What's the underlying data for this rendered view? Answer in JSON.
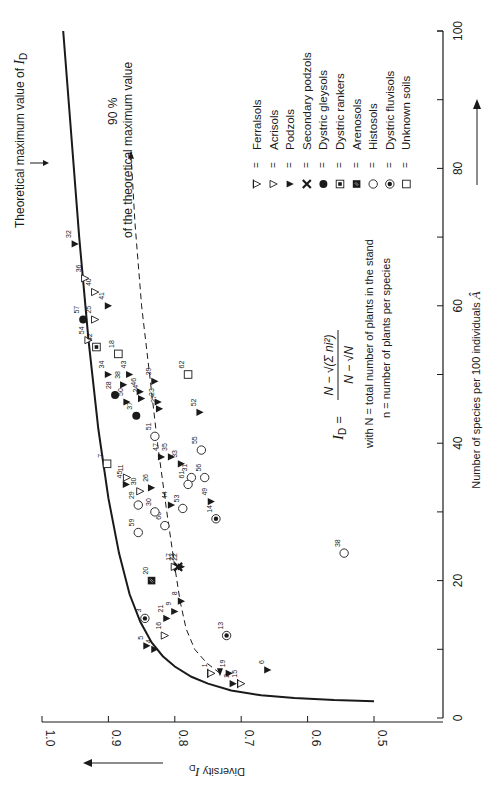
{
  "chart_data": {
    "type": "scatter",
    "orientation": "rotated 90 degrees counterclockwise (x-axis on right side, y-axis along bottom)",
    "title": "",
    "xlabel": "Number of species per 100 individuals Â",
    "ylabel": "Diversity I_D",
    "xlim": [
      0,
      100
    ],
    "ylim": [
      0.5,
      1.0
    ],
    "x_ticks": [
      0,
      20,
      40,
      60,
      80,
      100
    ],
    "y_ticks": [
      "1.0",
      "0.9",
      "0.8",
      "0.7",
      "0.6",
      "0.5"
    ],
    "grid": false,
    "legend_position": "upper right (rotated)",
    "legend": [
      {
        "symbol": "⧖",
        "key": "ferralsols",
        "label": "Ferralsols"
      },
      {
        "symbol": "▽",
        "key": "acrisols",
        "label": "Acrisols"
      },
      {
        "symbol": "▼",
        "key": "podzols",
        "label": "Podzols"
      },
      {
        "symbol": "✖",
        "key": "secondary_podzols",
        "label": "Secondary podzols"
      },
      {
        "symbol": "●",
        "key": "dystric_gleysols",
        "label": "Dystric gleysols"
      },
      {
        "symbol": "⊡",
        "key": "dystric_rankers",
        "label": "Dystric rankers"
      },
      {
        "symbol": "■",
        "key": "arenosols",
        "label": "Arenosols"
      },
      {
        "symbol": "○",
        "key": "histosols",
        "label": "Histosols"
      },
      {
        "symbol": "◉",
        "key": "dystric_fluvisols",
        "label": "Dystric fluvisols"
      },
      {
        "symbol": "□",
        "key": "unknown",
        "label": "Unknown soils"
      }
    ],
    "annotations": [
      "Theoretical maximum value of I_D",
      "90 % of the theoretical maximum value",
      "I_D = (N − √(Σ ni²)) / (N − √N)",
      "with N = total number of plants in the stand",
      "n = number of plants per species"
    ],
    "series": [
      {
        "name": "Ferralsols",
        "type": "ferralsols",
        "points": [
          {
            "id": "1",
            "x": 6.5,
            "D": 0.745
          },
          {
            "id": "15",
            "x": 5,
            "D": 0.7
          }
        ]
      },
      {
        "name": "Acrisols",
        "type": "acrisols",
        "points": [
          {
            "id": "16",
            "x": 12,
            "D": 0.815
          },
          {
            "id": "17",
            "x": 22,
            "D": 0.8
          },
          {
            "id": "30",
            "x": 33,
            "D": 0.852
          },
          {
            "id": "11",
            "x": 35,
            "D": 0.872
          },
          {
            "id": "54",
            "x": 55,
            "D": 0.93
          },
          {
            "id": "25",
            "x": 58,
            "D": 0.92
          },
          {
            "id": "40",
            "x": 62,
            "D": 0.92
          },
          {
            "id": "36",
            "x": 64,
            "D": 0.935
          }
        ]
      },
      {
        "name": "Podzols",
        "type": "podzols",
        "points": [
          {
            "id": "2",
            "x": 5,
            "D": 0.712
          },
          {
            "id": "4",
            "x": 10,
            "D": 0.83
          },
          {
            "id": "5",
            "x": 10.5,
            "D": 0.842
          },
          {
            "id": "6",
            "x": 7,
            "D": 0.66
          },
          {
            "id": "19",
            "x": 6.5,
            "D": 0.718
          },
          {
            "id": "21",
            "x": 14.5,
            "D": 0.812
          },
          {
            "id": "9",
            "x": 15.5,
            "D": 0.8
          },
          {
            "id": "8",
            "x": 17,
            "D": 0.79
          },
          {
            "id": "22",
            "x": 22,
            "D": 0.79
          },
          {
            "id": "44",
            "x": 31,
            "D": 0.805
          },
          {
            "id": "49",
            "x": 31.5,
            "D": 0.745
          },
          {
            "id": "26",
            "x": 33.5,
            "D": 0.835
          },
          {
            "id": "45",
            "x": 34,
            "D": 0.873
          },
          {
            "id": "35",
            "x": 38,
            "D": 0.805
          },
          {
            "id": "33",
            "x": 37,
            "D": 0.79
          },
          {
            "id": "47",
            "x": 38,
            "D": 0.82
          },
          {
            "id": "52",
            "x": 44.5,
            "D": 0.762
          },
          {
            "id": "27",
            "x": 45,
            "D": 0.823
          },
          {
            "id": "23",
            "x": 46,
            "D": 0.825
          },
          {
            "id": "24",
            "x": 46.5,
            "D": 0.85
          },
          {
            "id": "50",
            "x": 46,
            "D": 0.872
          },
          {
            "id": "46",
            "x": 47.5,
            "D": 0.852
          },
          {
            "id": "39",
            "x": 49,
            "D": 0.83
          },
          {
            "id": "38",
            "x": 48.5,
            "D": 0.877
          },
          {
            "id": "43",
            "x": 50,
            "D": 0.868
          },
          {
            "id": "34",
            "x": 50,
            "D": 0.9
          },
          {
            "id": "41",
            "x": 60,
            "D": 0.9
          },
          {
            "id": "32",
            "x": 69,
            "D": 0.95
          }
        ]
      },
      {
        "name": "Secondary podzols",
        "type": "secondary_podzols",
        "points": [
          {
            "id": "22",
            "x": 22,
            "D": 0.795
          }
        ]
      },
      {
        "name": "Dystric gleysols",
        "type": "dystric_gleysols",
        "points": [
          {
            "id": "28",
            "x": 47,
            "D": 0.89
          },
          {
            "id": "37",
            "x": 44,
            "D": 0.858
          },
          {
            "id": "57",
            "x": 58,
            "D": 0.938
          }
        ]
      },
      {
        "name": "Dystric rankers",
        "type": "dystric_rankers",
        "points": [
          {
            "id": "42",
            "x": 54,
            "D": 0.918
          }
        ]
      },
      {
        "name": "Arenosols",
        "type": "arenosols",
        "points": [
          {
            "id": "20",
            "x": 20,
            "D": 0.835
          }
        ]
      },
      {
        "name": "Histosols",
        "type": "histosols",
        "points": [
          {
            "id": "51",
            "x": 41,
            "D": 0.83
          },
          {
            "id": "55",
            "x": 39,
            "D": 0.76
          },
          {
            "id": "31",
            "x": 35,
            "D": 0.775
          },
          {
            "id": "61",
            "x": 34,
            "D": 0.78
          },
          {
            "id": "56",
            "x": 35,
            "D": 0.755
          },
          {
            "id": "29",
            "x": 31,
            "D": 0.855
          },
          {
            "id": "53",
            "x": 30.5,
            "D": 0.788
          },
          {
            "id": "59",
            "x": 27,
            "D": 0.855
          },
          {
            "id": "60",
            "x": 28,
            "D": 0.815
          },
          {
            "id": "30",
            "x": 30,
            "D": 0.83
          },
          {
            "id": "38",
            "x": 24,
            "D": 0.545
          }
        ]
      },
      {
        "name": "Dystric fluvisols",
        "type": "dystric_fluvisols",
        "points": [
          {
            "id": "3",
            "x": 14.5,
            "D": 0.845
          },
          {
            "id": "13",
            "x": 12,
            "D": 0.722
          },
          {
            "id": "14",
            "x": 29,
            "D": 0.738
          }
        ]
      },
      {
        "name": "Unknown soils",
        "type": "unknown",
        "points": [
          {
            "id": "7",
            "x": 37,
            "D": 0.902
          },
          {
            "id": "18",
            "x": 53,
            "D": 0.885
          },
          {
            "id": "62",
            "x": 50,
            "D": 0.78
          }
        ]
      }
    ],
    "curves": [
      {
        "name": "Theoretical maximum value of I_D",
        "style": "solid",
        "points": [
          [
            2.5,
            0.5
          ],
          [
            3,
            0.62
          ],
          [
            4,
            0.7
          ],
          [
            6,
            0.77
          ],
          [
            8,
            0.81
          ],
          [
            12,
            0.845
          ],
          [
            20,
            0.88
          ],
          [
            40,
            0.92
          ],
          [
            60,
            0.945
          ],
          [
            80,
            0.96
          ],
          [
            100,
            0.97
          ]
        ]
      },
      {
        "name": "90 % of the theoretical maximum value",
        "style": "dashed",
        "points": [
          [
            6,
            0.73
          ],
          [
            10,
            0.77
          ],
          [
            17,
            0.792
          ],
          [
            30,
            0.815
          ],
          [
            45,
            0.835
          ],
          [
            60,
            0.855
          ],
          [
            80,
            0.87
          ]
        ]
      }
    ]
  },
  "labels": {
    "theoretical_max": "Theoretical maximum value of",
    "theoretical_max_sym": "I",
    "theoretical_max_sub": "D",
    "ninety_pct": "90 %",
    "ninety_pct_desc": "of the theoretical maximum value",
    "xlabel": "Number of species per 100 individuals",
    "xlabel_sym": "Â",
    "ylabel": "Diversity",
    "ylabel_sym": "I",
    "ylabel_sub": "D",
    "formula_lhs": "I",
    "formula_lhs_sub": "D",
    "formula_eq": "=",
    "formula_num": "N − √(Σ ni²)",
    "formula_den": "N − √N",
    "with_line": "with N = total number of plants in the stand",
    "n_line": "n = number of plants per species"
  }
}
